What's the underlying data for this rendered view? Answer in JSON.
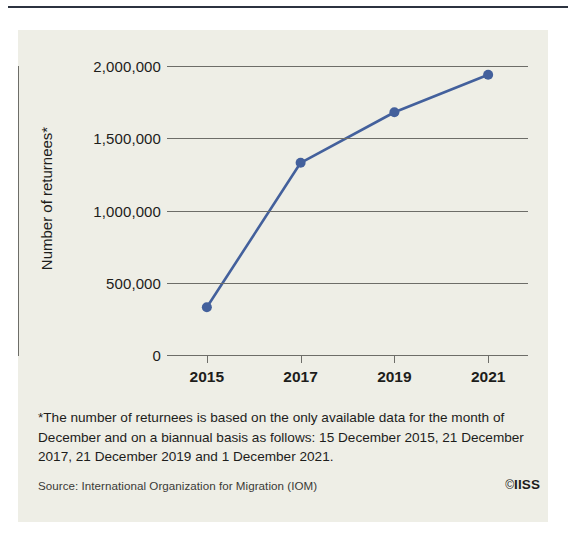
{
  "figure": {
    "copyright": "IISS",
    "copyright_symbol": "©",
    "footnote": "*The number of returnees is based on the only available data for the month of December and on a biannual basis as follows: 15 December 2015, 21 December 2017, 21 December 2019 and 1 December 2021.",
    "source": "Source: International Organization for Migration (IOM)",
    "rule_color": "#2c3340",
    "panel_color": "#eeeee6"
  },
  "chart_data": {
    "type": "line",
    "title": "",
    "xlabel": "",
    "ylabel": "Number of returnees*",
    "categories": [
      "2015",
      "2017",
      "2019",
      "2021"
    ],
    "x": [
      2015,
      2017,
      2019,
      2021
    ],
    "values": [
      330000,
      1330000,
      1680000,
      1940000
    ],
    "series": [
      {
        "name": "Number of returnees",
        "values": [
          330000,
          1330000,
          1680000,
          1940000
        ],
        "color": "#43609c",
        "marker": "circle"
      }
    ],
    "ylim": [
      0,
      2000000
    ],
    "yticks": [
      0,
      500000,
      1000000,
      1500000,
      2000000
    ],
    "ytick_labels": [
      "0",
      "500,000",
      "1,000,000",
      "1,500,000",
      "2,000,000"
    ],
    "xtick_labels": [
      "2015",
      "2017",
      "2019",
      "2021"
    ],
    "grid": true,
    "grid_color": "#6d6d68",
    "legend": "none"
  }
}
